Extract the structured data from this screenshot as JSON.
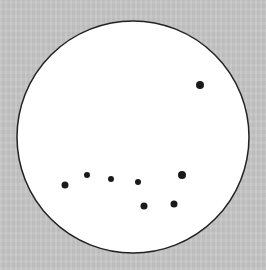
{
  "diagram": {
    "background_color": "#c6c6c6",
    "circle": {
      "cx": 133,
      "cy": 137,
      "r": 116,
      "fill": "#ffffff",
      "stroke": "#222222"
    },
    "dot_color": "#1a1a1a",
    "dots": [
      {
        "x": 200,
        "y": 85,
        "r": 4
      },
      {
        "x": 65,
        "y": 185,
        "r": 3.5
      },
      {
        "x": 87,
        "y": 175,
        "r": 3
      },
      {
        "x": 111,
        "y": 179,
        "r": 3
      },
      {
        "x": 138,
        "y": 182,
        "r": 3
      },
      {
        "x": 182,
        "y": 175,
        "r": 4
      },
      {
        "x": 144,
        "y": 206,
        "r": 3.5
      },
      {
        "x": 174,
        "y": 204,
        "r": 3.5
      }
    ]
  }
}
